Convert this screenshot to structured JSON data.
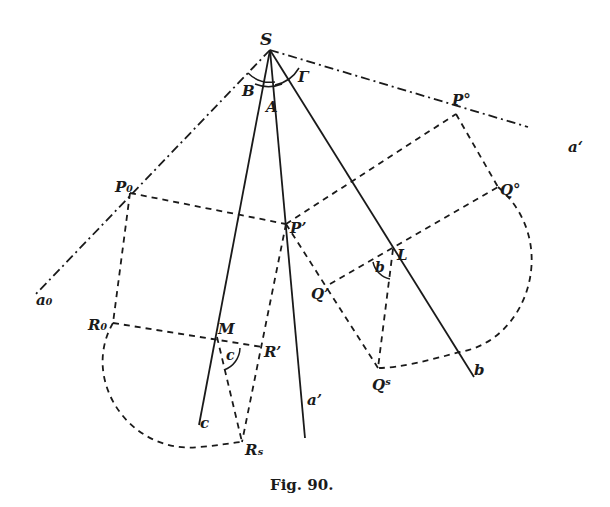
{
  "figure": {
    "caption": "Fig. 90.",
    "labels": {
      "S": "S",
      "B": "B",
      "A": "A",
      "Gamma": "Γ",
      "P_zero_sup": "P°",
      "a_prime_prime": "a‘",
      "Q_zero_sup": "Q°",
      "P_zero_sub": "P₀",
      "P_prime": "P’",
      "L": "L",
      "b_angle": "b",
      "Q_prime": "Q’",
      "a_zero": "a₀",
      "R_zero": "R₀",
      "M": "M",
      "c_angle": "c",
      "R_prime": "R’",
      "Q_s": "Qˢ",
      "b_line": "b",
      "c_line": "c",
      "a_prime": "a’",
      "R_s": "Rₛ"
    },
    "points": {
      "S": [
        270,
        50
      ],
      "P0_sup": [
        456,
        114
      ],
      "Q0_sup": [
        498,
        187
      ],
      "P0_sub": [
        130,
        193
      ],
      "P_prime": [
        286,
        224
      ],
      "L": [
        393,
        249
      ],
      "Q_prime": [
        330,
        284
      ],
      "R0": [
        113,
        323
      ],
      "M": [
        217,
        337
      ],
      "R_prime": [
        262,
        347
      ],
      "Qs": [
        378,
        368
      ],
      "Rs": [
        242,
        442
      ]
    }
  }
}
